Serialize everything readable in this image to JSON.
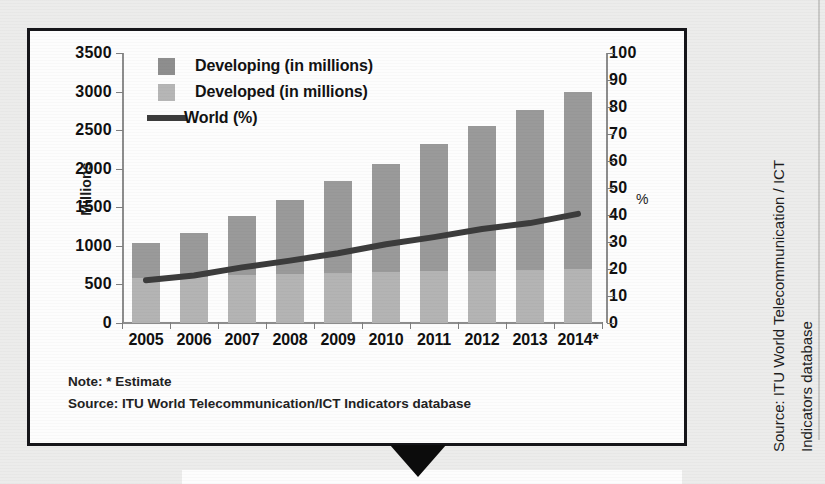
{
  "chart_data": {
    "type": "bar",
    "title": "",
    "subtitle": "",
    "xlabel": "",
    "ylabel": "Millions",
    "y2label": "%",
    "ylim": [
      0,
      3500
    ],
    "y2lim": [
      0,
      100
    ],
    "yticks": [
      3500,
      3000,
      2500,
      2000,
      1500,
      1000,
      500,
      0
    ],
    "y2ticks": [
      100,
      90,
      80,
      70,
      60,
      50,
      40,
      30,
      20,
      10,
      0
    ],
    "grid": false,
    "legend_position": "top-left",
    "categories": [
      "2005",
      "2006",
      "2007",
      "2008",
      "2009",
      "2010",
      "2011",
      "2012",
      "2013",
      "2014*"
    ],
    "series": [
      {
        "name": "Developing (in millions)",
        "type": "bar",
        "stack": "total",
        "color": "#9a9a9a",
        "axis": "left",
        "values": [
          450,
          570,
          770,
          950,
          1190,
          1400,
          1650,
          1880,
          2070,
          2300
        ]
      },
      {
        "name": "Developed (in millions)",
        "type": "bar",
        "stack": "total",
        "color": "#b4b4b4",
        "axis": "left",
        "values": [
          590,
          600,
          620,
          640,
          650,
          660,
          670,
          680,
          690,
          700
        ]
      },
      {
        "name": "World (%)",
        "type": "line",
        "color": "#3c3c3c",
        "axis": "right",
        "values": [
          15.8,
          17.6,
          20.6,
          23.1,
          25.8,
          29.2,
          31.8,
          34.8,
          37.0,
          40.4
        ]
      }
    ],
    "totals": [
      1040,
      1170,
      1390,
      1590,
      1840,
      2060,
      2320,
      2560,
      2760,
      3000
    ],
    "annotations": [
      "Note: * Estimate",
      "Source: ITU World Telecommunication/ICT Indicators database"
    ]
  },
  "legend": {
    "items": [
      {
        "label": "Developing (in millions)",
        "swatch": "developing",
        "color": "#8e8e8e"
      },
      {
        "label": "Developed (in millions)",
        "swatch": "developed",
        "color": "#b6b6b6"
      },
      {
        "label": "World (%)",
        "swatch": "line",
        "color": "#3c3c3c"
      }
    ]
  },
  "axes": {
    "left_title": "Millions",
    "right_title": "%"
  },
  "footnotes": {
    "note": "Note: * Estimate",
    "source": "Source: ITU World Telecommunication/ICT Indicators database"
  },
  "side_source": {
    "line1": "Source: ITU World Telecommunication / ICT",
    "line2": "Indicators database"
  }
}
